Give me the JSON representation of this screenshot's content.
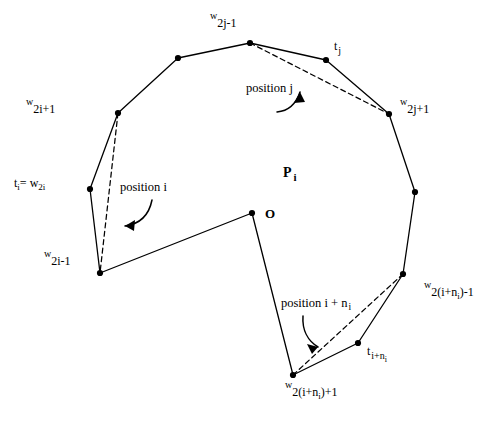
{
  "figure": {
    "background": "#ffffff",
    "stroke_color": "#000000",
    "vertex_color": "#000000"
  },
  "labels": {
    "w_2j_minus_1": {
      "base": "w",
      "sub": "2j-1"
    },
    "t_j": {
      "base": "t",
      "sub": "j"
    },
    "w_2j_plus_1": {
      "base": "w",
      "sub": "2j+1"
    },
    "w_2i_plus_1": {
      "base": "w",
      "sub": "2i+1"
    },
    "t_i_eq_w_2i": {
      "base": "t",
      "sub1": "i",
      "eq": "= w",
      "sub2": "2i"
    },
    "w_2i_minus_1": {
      "base": "w",
      "sub": "2i-1"
    },
    "w_2_i_plus_ni_minus_1": {
      "base": "w",
      "sub_pre": "2(i+n",
      "sub_sub": "i",
      "sub_post": ")-1"
    },
    "w_2_i_plus_ni_plus_1": {
      "base": "w",
      "sub_pre": "2(i+n",
      "sub_sub": "i",
      "sub_post": ")+1"
    },
    "t_i_plus_ni": {
      "base": "t",
      "sub_pre": "i+n",
      "sub_sub": "i"
    },
    "polygon_name": {
      "base": "P",
      "sub": "i"
    },
    "origin": "O"
  },
  "annotations": {
    "position_i": "position i",
    "position_j": "position j",
    "position_i_plus_ni_pre": "position i + n",
    "position_i_plus_ni_sub": "i"
  },
  "geometry": {
    "vertices": [
      {
        "name": "w_2j_minus_1",
        "x": 250,
        "y": 43
      },
      {
        "name": "upper_left_mid",
        "x": 178,
        "y": 58
      },
      {
        "name": "w_2i_plus_1",
        "x": 118,
        "y": 113
      },
      {
        "name": "t_i_eq_w_2i",
        "x": 90,
        "y": 189
      },
      {
        "name": "w_2i_minus_1",
        "x": 100,
        "y": 273
      },
      {
        "name": "origin_O",
        "x": 252,
        "y": 213
      },
      {
        "name": "w_2_i_plus_ni_plus_1",
        "x": 293,
        "y": 375
      },
      {
        "name": "t_i_plus_ni",
        "x": 358,
        "y": 343
      },
      {
        "name": "w_2_i_plus_ni_minus_1",
        "x": 403,
        "y": 274
      },
      {
        "name": "right_mid",
        "x": 415,
        "y": 192
      },
      {
        "name": "w_2j_plus_1",
        "x": 389,
        "y": 114
      },
      {
        "name": "t_j",
        "x": 326,
        "y": 60
      }
    ],
    "dashed_chords": [
      {
        "name": "chord-position-i",
        "x1": 118,
        "y1": 113,
        "x2": 100,
        "y2": 273
      },
      {
        "name": "chord-position-j",
        "x1": 250,
        "y1": 43,
        "x2": 389,
        "y2": 114
      },
      {
        "name": "chord-position-i-plus-ni",
        "x1": 293,
        "y1": 375,
        "x2": 403,
        "y2": 274
      }
    ]
  }
}
